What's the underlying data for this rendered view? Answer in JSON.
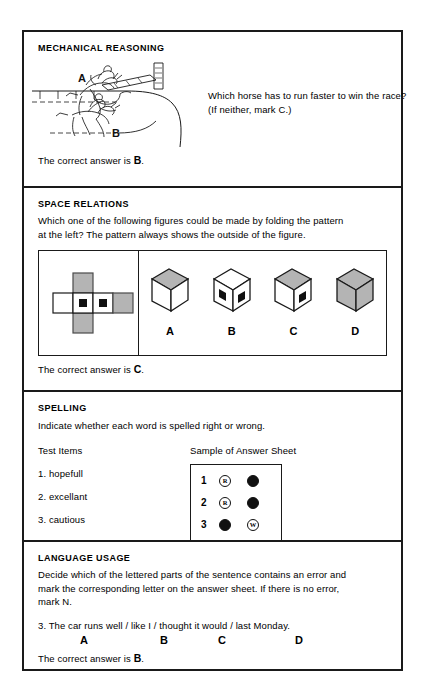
{
  "document": {
    "title": "Sample Test Items"
  },
  "sections": [
    {
      "id": "mechanical-reasoning",
      "title": "MECHANICAL REASONING",
      "question_line_1": "Which horse has to run faster to win the race?",
      "question_line_2": "(If neither, mark C.)",
      "figure_labels": {
        "a": "A",
        "b": "B"
      },
      "answer_prefix": "The correct answer is ",
      "answer_value": "B",
      "answer_suffix": "."
    },
    {
      "id": "space-relations",
      "title": "SPACE RELATIONS",
      "instructions_line_1": "Which one of the following figures could be made by folding the pattern",
      "instructions_line_2": "at the left?  The pattern  always shows the outside of the figure.",
      "options": [
        {
          "label": "A",
          "top": "gray",
          "left": "white",
          "right": "white",
          "left_dot": false,
          "right_dot": false
        },
        {
          "label": "B",
          "top": "white",
          "left": "white",
          "right": "white",
          "left_dot": true,
          "right_dot": true
        },
        {
          "label": "C",
          "top": "gray",
          "left": "white",
          "right": "white",
          "left_dot": false,
          "right_dot": true
        },
        {
          "label": "D",
          "top": "gray",
          "left": "gray",
          "right": "gray",
          "left_dot": false,
          "right_dot": false
        }
      ],
      "answer_prefix": "The correct answer is ",
      "answer_value": "C",
      "answer_suffix": "."
    },
    {
      "id": "spelling",
      "title": "SPELLING",
      "instructions": "Indicate whether each word is spelled right or wrong.",
      "left_column_header": "Test Items",
      "right_column_header": "Sample of Answer Sheet",
      "items": [
        {
          "number": "1.",
          "word": "hopefull"
        },
        {
          "number": "2.",
          "word": "excellant"
        },
        {
          "number": "3.",
          "word": "cautious"
        }
      ],
      "answer_sheet_rows": [
        {
          "number": "1",
          "r": "R",
          "r_filled": false,
          "w": "W",
          "w_filled": true
        },
        {
          "number": "2",
          "r": "R",
          "r_filled": false,
          "w": "W",
          "w_filled": true
        },
        {
          "number": "3",
          "r": "R",
          "r_filled": true,
          "w": "W",
          "w_filled": false
        }
      ]
    },
    {
      "id": "language-usage",
      "title": "LANGUAGE USAGE",
      "instructions_line_1": "Decide which of the lettered parts of the sentence contains an error and",
      "instructions_line_2": "mark the corresponding  letter on the answer sheet.  If there is no error,",
      "instructions_line_3": "mark N.",
      "sentence": "3.  The car runs well / like I / thought it would / last Monday.",
      "part_letters": [
        "A",
        "B",
        "C",
        "D"
      ],
      "answer_prefix": "The correct answer is ",
      "answer_value": "B",
      "answer_suffix": "."
    }
  ],
  "colors": {
    "ink": "#1a1a1a",
    "gray_face": "#b4b4b4",
    "paper": "#ffffff"
  }
}
